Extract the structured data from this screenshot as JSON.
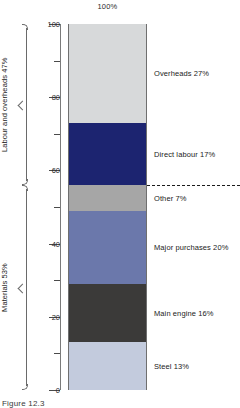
{
  "chart_data": {
    "type": "bar",
    "title": "100%",
    "subtitle": "",
    "xlabel": "",
    "ylabel": "",
    "ylim": [
      0,
      100
    ],
    "grid": false,
    "legend": "right-of-bar labels",
    "stacked": true,
    "categories": [
      "Cost breakdown"
    ],
    "series": [
      {
        "name": "Steel",
        "label": "Steel 13%",
        "value": 13,
        "start": 0,
        "end": 13,
        "color": "#c3cbdd"
      },
      {
        "name": "Main engine",
        "label": "Main engine 16%",
        "value": 16,
        "start": 13,
        "end": 29,
        "color": "#3b3a39"
      },
      {
        "name": "Major purchases",
        "label": "Major purchases 20%",
        "value": 20,
        "start": 29,
        "end": 49,
        "color": "#6b78ab"
      },
      {
        "name": "Other",
        "label": "Other 7%",
        "value": 7,
        "start": 49,
        "end": 56,
        "color": "#a6a6a6"
      },
      {
        "name": "Direct labour",
        "label": "Direct labour 17%",
        "value": 17,
        "start": 56,
        "end": 73,
        "color": "#1c2470"
      },
      {
        "name": "Overheads",
        "label": "Overheads 27%",
        "value": 27,
        "start": 73,
        "end": 100,
        "color": "#d7d9da"
      }
    ],
    "yticks_major": [
      0,
      20,
      40,
      60,
      80,
      100
    ],
    "yticks_major_labels": [
      "0",
      "20",
      "40",
      "60",
      "80",
      "100"
    ],
    "yticks_minor": [
      10,
      30,
      50,
      70,
      90
    ],
    "annotations": [
      {
        "name": "divider",
        "type": "dashed-line",
        "value": 56
      }
    ],
    "groups": [
      {
        "name": "labour-and-overheads",
        "label": "Labour and overheads 47%",
        "start": 56,
        "end": 100,
        "total": 47
      },
      {
        "name": "materials",
        "label": "Materials 53%",
        "start": 0,
        "end": 56,
        "total": 53
      }
    ]
  },
  "caption": {
    "text": "Figure 12.3"
  }
}
